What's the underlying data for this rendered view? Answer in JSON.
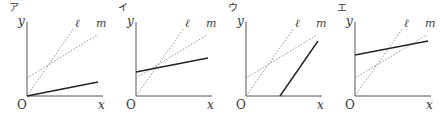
{
  "figure": {
    "colors": {
      "axis": "#555555",
      "reference_line": "#8a8a8a",
      "answer_line": "#222222",
      "text": "#333333"
    },
    "panels": [
      {
        "label": "ア",
        "origin": [
          27,
          96
        ],
        "label_pos": [
          9,
          11
        ],
        "y_axis_top": 22,
        "x_axis_right": 103,
        "axis_labels": {
          "y": "y",
          "x": "x",
          "origin": "O"
        },
        "reference_lines": [
          {
            "name": "ℓ",
            "from": [
              27,
              96
            ],
            "to": [
              74,
              28
            ],
            "label_pos": [
              75,
              27
            ]
          },
          {
            "name": "m",
            "from": [
              27,
              78
            ],
            "to": [
              97,
              35
            ],
            "label_pos": [
              96,
              27
            ]
          }
        ],
        "answer_line": {
          "from": [
            27,
            96
          ],
          "to": [
            98,
            82
          ]
        }
      },
      {
        "label": "イ",
        "origin": [
          136,
          96
        ],
        "label_pos": [
          118,
          11
        ],
        "y_axis_top": 22,
        "x_axis_right": 212,
        "axis_labels": {
          "y": "y",
          "x": "x",
          "origin": "O"
        },
        "reference_lines": [
          {
            "name": "ℓ",
            "from": [
              136,
              96
            ],
            "to": [
              184,
              28
            ],
            "label_pos": [
              185,
              27
            ]
          },
          {
            "name": "m",
            "from": [
              136,
              78
            ],
            "to": [
              207,
              35
            ],
            "label_pos": [
              206,
              27
            ]
          }
        ],
        "answer_line": {
          "from": [
            136,
            72
          ],
          "to": [
            208,
            58
          ]
        }
      },
      {
        "label": "ウ",
        "origin": [
          246,
          96
        ],
        "label_pos": [
          228,
          11
        ],
        "y_axis_top": 22,
        "x_axis_right": 322,
        "axis_labels": {
          "y": "y",
          "x": "x",
          "origin": "O"
        },
        "reference_lines": [
          {
            "name": "ℓ",
            "from": [
              246,
              96
            ],
            "to": [
              294,
              28
            ],
            "label_pos": [
              295,
              27
            ]
          },
          {
            "name": "m",
            "from": [
              246,
              78
            ],
            "to": [
              317,
              35
            ],
            "label_pos": [
              316,
              27
            ]
          }
        ],
        "answer_line": {
          "from": [
            280,
            96
          ],
          "to": [
            318,
            41
          ]
        }
      },
      {
        "label": "エ",
        "origin": [
          355,
          96
        ],
        "label_pos": [
          337,
          11
        ],
        "y_axis_top": 22,
        "x_axis_right": 431,
        "axis_labels": {
          "y": "y",
          "x": "x",
          "origin": "O"
        },
        "reference_lines": [
          {
            "name": "ℓ",
            "from": [
              355,
              96
            ],
            "to": [
              403,
              28
            ],
            "label_pos": [
              404,
              27
            ]
          },
          {
            "name": "m",
            "from": [
              355,
              78
            ],
            "to": [
              427,
              35
            ],
            "label_pos": [
              425,
              27
            ]
          }
        ],
        "answer_line": {
          "from": [
            355,
            55
          ],
          "to": [
            428,
            41
          ]
        }
      }
    ]
  }
}
